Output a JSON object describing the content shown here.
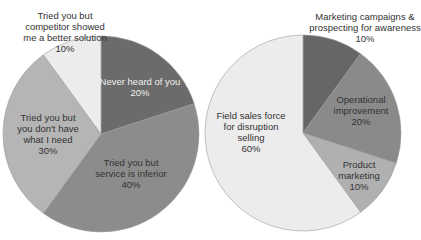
{
  "chart_data": [
    {
      "type": "pie",
      "title": "",
      "slices": [
        {
          "label": "Never heard of you",
          "value": 20,
          "color": "#6b6b6b"
        },
        {
          "label": "Tried you but service is inferior",
          "value": 40,
          "color": "#8c8c8c"
        },
        {
          "label": "Tried you but you don't have what I need",
          "value": 30,
          "color": "#b5b5b5"
        },
        {
          "label": "Tried you but competitor showed me a better solution",
          "value": 10,
          "color": "#ececec"
        }
      ]
    },
    {
      "type": "pie",
      "title": "",
      "slices": [
        {
          "label": "Marketing campaigns & prospecting for awareness",
          "value": 10,
          "color": "#666666"
        },
        {
          "label": "Operational improvement",
          "value": 20,
          "color": "#8a8a8a"
        },
        {
          "label": "Product marketing",
          "value": 10,
          "color": "#b0b0b0"
        },
        {
          "label": "Field sales force for disruption selling",
          "value": 60,
          "color": "#ececec"
        }
      ]
    }
  ],
  "labels": {
    "left": {
      "never": [
        "Never heard of you",
        "20%"
      ],
      "inferior": [
        "Tried you but",
        "service is inferior",
        "40%"
      ],
      "need": [
        "Tried you but",
        "you don't have",
        "what I need",
        "30%"
      ],
      "competitor": [
        "Tried you but",
        "competitor showed",
        "me a better solution",
        "10%"
      ]
    },
    "right": {
      "marketing": [
        "Marketing campaigns &",
        "prospecting for awareness",
        "10%"
      ],
      "operational": [
        "Operational",
        "improvement",
        "20%"
      ],
      "product": [
        "Product",
        "marketing",
        "10%"
      ],
      "field": [
        "Field sales force",
        "for disruption",
        "selling",
        "60%"
      ]
    }
  }
}
